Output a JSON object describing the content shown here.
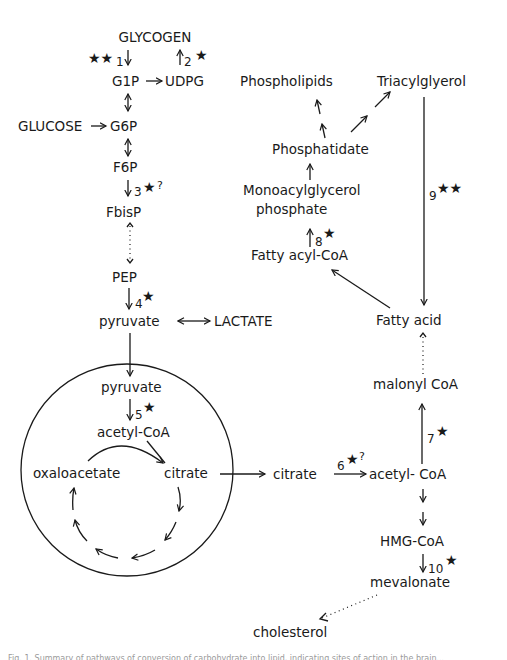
{
  "diagram": {
    "nodes": {
      "glycogen": "GLYCOGEN",
      "g1p": "G1P",
      "udpg": "UDPG",
      "glucose": "GLUCOSE",
      "g6p": "G6P",
      "f6p": "F6P",
      "fbisp": "FbisP",
      "pep": "PEP",
      "pyruvate_cyto": "pyruvate",
      "lactate": "LACTATE",
      "pyruvate_mito": "pyruvate",
      "acetylcoa_mito": "acetyl-CoA",
      "oxaloacetate": "oxaloacetate",
      "citrate_mito": "citrate",
      "citrate_cyto": "citrate",
      "acetylcoa_cyto": "acetyl- CoA",
      "malonylcoa": "malonyl CoA",
      "fattyacid": "Fatty acid",
      "fattyacylcoa": "Fatty acyl-CoA",
      "monoacylglycerol_1": "Monoacylglycerol",
      "monoacylglycerol_2": "phosphate",
      "phosphatidate": "Phosphatidate",
      "phospholipids": "Phospholipids",
      "triacylglycerol": "Triacylglyerol",
      "hmgcoa": "HMG-CoA",
      "mevalonate": "mevalonate",
      "cholesterol": "cholesterol"
    },
    "steps": [
      {
        "id": "1",
        "label": "1",
        "marker": "★★",
        "question": ""
      },
      {
        "id": "2",
        "label": "2",
        "marker": "★",
        "question": ""
      },
      {
        "id": "3",
        "label": "3",
        "marker": "★",
        "question": "?"
      },
      {
        "id": "4",
        "label": "4",
        "marker": "★",
        "question": ""
      },
      {
        "id": "5",
        "label": "5",
        "marker": "★",
        "question": ""
      },
      {
        "id": "6",
        "label": "6",
        "marker": "★",
        "question": "?"
      },
      {
        "id": "7",
        "label": "7",
        "marker": "★",
        "question": ""
      },
      {
        "id": "8",
        "label": "8",
        "marker": "★",
        "question": ""
      },
      {
        "id": "9",
        "label": "9",
        "marker": "★★",
        "question": ""
      },
      {
        "id": "10",
        "label": "10",
        "marker": "★",
        "question": ""
      }
    ]
  },
  "caption": "Fig. 1. Summary of pathways of conversion of carbohydrate into lipid, indicating sites of action in the brain..."
}
